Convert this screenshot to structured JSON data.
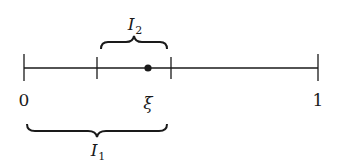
{
  "diagram": {
    "type": "number-line-with-intervals",
    "colors": {
      "line": "#1a1a1a",
      "background": "#ffffff"
    },
    "axis": {
      "start": 0,
      "end": 1
    },
    "ticks": [
      {
        "id": "t0",
        "label": "0"
      },
      {
        "id": "t_a",
        "label": ""
      },
      {
        "id": "t_b",
        "label": ""
      },
      {
        "id": "t1",
        "label": "1"
      }
    ],
    "point": {
      "label": "ξ"
    },
    "intervals": [
      {
        "name": "I",
        "sub": "2",
        "position": "above",
        "spans": "t_a to t_b"
      },
      {
        "name": "I",
        "sub": "1",
        "position": "below",
        "spans": "t0 to t_b"
      }
    ],
    "labels": {
      "zero": "0",
      "one": "1",
      "xi": "ξ",
      "i1_main": "I",
      "i1_sub": "1",
      "i2_main": "I",
      "i2_sub": "2"
    }
  }
}
